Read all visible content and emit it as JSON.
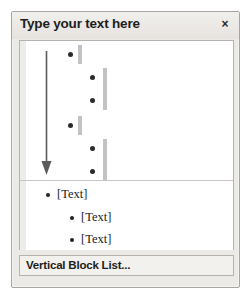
{
  "pane": {
    "title": "Type your text here",
    "close_label": "×",
    "close_icon": "close-icon"
  },
  "preview": {
    "arrow_icon": "down-arrow-icon",
    "nodes": [
      {
        "level": 1,
        "bullet_x": 48,
        "bullet_y": 11,
        "bar_x": 58,
        "bar_y": 4,
        "bar_h": 19
      },
      {
        "level": 2,
        "bullet_x": 70,
        "bullet_y": 34,
        "bar_x": 83,
        "bar_y": 27,
        "bar_h": 42
      },
      {
        "level": 2,
        "bullet_x": 70,
        "bullet_y": 57
      },
      {
        "level": 1,
        "bullet_x": 48,
        "bullet_y": 82,
        "bar_x": 58,
        "bar_y": 75,
        "bar_h": 19
      },
      {
        "level": 2,
        "bullet_x": 70,
        "bullet_y": 105,
        "bar_x": 83,
        "bar_y": 98,
        "bar_h": 42
      },
      {
        "level": 2,
        "bullet_x": 70,
        "bullet_y": 128
      }
    ]
  },
  "text_entries": [
    {
      "label": "[Text]",
      "level": 1,
      "left": 26,
      "top": 6
    },
    {
      "label": "[Text]",
      "level": 2,
      "left": 50,
      "top": 29
    },
    {
      "label": "[Text]",
      "level": 2,
      "left": 50,
      "top": 51
    }
  ],
  "layout": {
    "name": "Vertical Block List..."
  },
  "colors": {
    "pane_background": "#eceae6",
    "pane_border": "#a8a5a0",
    "content_background": "#ffffff",
    "bar_gray": "#c3c3c3",
    "bullet_black": "#2b2b2b",
    "strip_gray": "#ececec"
  }
}
